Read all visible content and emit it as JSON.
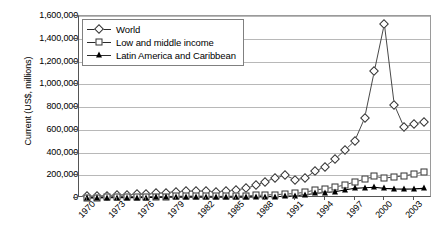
{
  "chart_data": {
    "type": "line",
    "title": "",
    "xlabel": "",
    "ylabel": "Current (US$, millions)",
    "ylim": [
      0,
      1600000
    ],
    "ytick_step": 200000,
    "ytick_labels": [
      "0",
      "200,000",
      "400,000",
      "600,000",
      "800,000",
      "1,000,000",
      "1,200,000",
      "1,400,000",
      "1,600,000"
    ],
    "ytick_values": [
      0,
      200000,
      400000,
      600000,
      800000,
      1000000,
      1200000,
      1400000,
      1600000
    ],
    "grid": true,
    "legend_position": "top-left",
    "x": [
      1970,
      1971,
      1972,
      1973,
      1974,
      1975,
      1976,
      1977,
      1978,
      1979,
      1980,
      1981,
      1982,
      1983,
      1984,
      1985,
      1986,
      1987,
      1988,
      1989,
      1990,
      1991,
      1992,
      1993,
      1994,
      1995,
      1996,
      1997,
      1998,
      1999,
      2000,
      2001,
      2002,
      2003,
      2004
    ],
    "xtick_labels": [
      "1970",
      "1973",
      "1976",
      "1979",
      "1982",
      "1985",
      "1988",
      "1991",
      "1994",
      "1997",
      "2000",
      "2003"
    ],
    "xtick_values": [
      1970,
      1973,
      1976,
      1979,
      1982,
      1985,
      1988,
      1991,
      1994,
      1997,
      2000,
      2003
    ],
    "series": [
      {
        "name": "World",
        "marker": "open-diamond",
        "color": "#333333",
        "values": [
          14000,
          17000,
          21000,
          26000,
          29000,
          32000,
          35000,
          40000,
          48000,
          55000,
          58000,
          62000,
          60000,
          55000,
          60000,
          70000,
          85000,
          110000,
          145000,
          175000,
          200000,
          160000,
          175000,
          235000,
          275000,
          340000,
          420000,
          500000,
          700000,
          1120000,
          1530000,
          820000,
          620000,
          650000,
          670000
        ]
      },
      {
        "name": "Low and middle income",
        "marker": "open-square",
        "color": "#333333",
        "values": [
          3000,
          4000,
          5000,
          6000,
          7000,
          8000,
          9000,
          11000,
          13000,
          15000,
          16000,
          17000,
          16000,
          14000,
          15000,
          16000,
          18000,
          22000,
          26000,
          30000,
          34000,
          40000,
          50000,
          70000,
          82000,
          95000,
          115000,
          140000,
          165000,
          190000,
          175000,
          185000,
          195000,
          210000,
          230000
        ]
      },
      {
        "name": "Latin America and Caribbean",
        "marker": "filled-triangle",
        "color": "#000000",
        "values": [
          1000,
          1500,
          2000,
          2500,
          3000,
          3500,
          4000,
          5000,
          6000,
          7000,
          7500,
          8000,
          7000,
          6000,
          6500,
          7000,
          7500,
          9000,
          11000,
          13000,
          15000,
          20000,
          28000,
          40000,
          48000,
          55000,
          70000,
          85000,
          90000,
          95000,
          85000,
          80000,
          78000,
          80000,
          85000
        ]
      }
    ]
  }
}
